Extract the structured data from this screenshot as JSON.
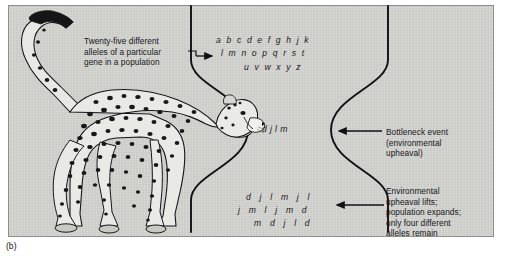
{
  "figure": {
    "sublabel": "(b)",
    "panel_color": "#d4d4d1",
    "ink_color": "#1a1a1c"
  },
  "captions": {
    "alleles": "Twenty-five different\nalleles of a particular\ngene in a population",
    "bottleneck": "Bottleneck event\n(environmental\nupheaval)",
    "expansion": "Environmental\nupheaval lifts;\npopulation expands;\nonly four different\nalleles remain"
  },
  "alleles": {
    "before_rows": [
      "a  b  c  d  e  f  g  h  j  k",
      "l  m  n  o  p  q  r  s  t",
      "u  v  w  x  y  z"
    ],
    "neck_row": "d   j   l   m",
    "after_rows": [
      "d   j   l   m   j   l",
      "j   m   l   j   m   d",
      "m   d   j   l   d"
    ]
  },
  "illustration": {
    "subject": "cheetah"
  }
}
